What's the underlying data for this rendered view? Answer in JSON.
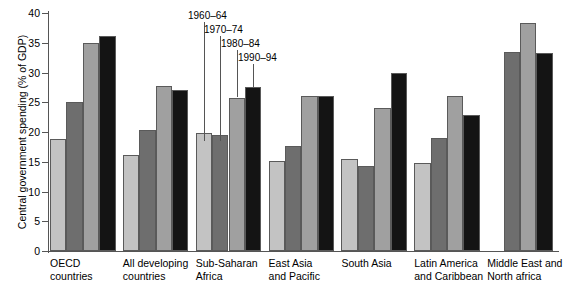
{
  "chart_data": {
    "type": "bar",
    "title": "",
    "xlabel": "",
    "ylabel": "Central government spending (% of GDP)",
    "ylim": [
      0,
      40
    ],
    "ytick_labels": [
      "0",
      "5",
      "10",
      "15",
      "20",
      "25",
      "30",
      "35",
      "40"
    ],
    "ytick_values": [
      0,
      5,
      10,
      15,
      20,
      25,
      30,
      35,
      40
    ],
    "grid": false,
    "legend_position": "inside-top-center",
    "categories": [
      "OECD countries",
      "All developing countries",
      "Sub-Saharan Africa",
      "East Asia and Pacific",
      "South Asia",
      "Latin America and Caribbean",
      "Middle East and North africa"
    ],
    "category_lines": [
      [
        "OECD",
        "countries"
      ],
      [
        "All developing",
        "countries"
      ],
      [
        "Sub-Saharan",
        "Africa"
      ],
      [
        "East Asia",
        "and Pacific"
      ],
      [
        "South Asia",
        ""
      ],
      [
        "Latin America",
        "and Caribbean"
      ],
      [
        "Middle East and",
        "North africa"
      ]
    ],
    "series": [
      {
        "name": "1960–64",
        "color": "#c3c3c3",
        "values": [
          18.8,
          16.2,
          19.9,
          15.2,
          15.4,
          14.8,
          null
        ]
      },
      {
        "name": "1970–74",
        "color": "#6e6e6e",
        "values": [
          25.0,
          20.4,
          19.5,
          17.6,
          14.3,
          19.0,
          33.4
        ]
      },
      {
        "name": "1980–84",
        "color": "#a0a0a0",
        "values": [
          34.9,
          27.8,
          25.8,
          26.0,
          24.0,
          26.1,
          38.4
        ]
      },
      {
        "name": "1990–94",
        "color": "#141414",
        "values": [
          36.2,
          27.0,
          27.6,
          26.0,
          30.0,
          22.8,
          33.2
        ]
      }
    ]
  },
  "legend_callouts": [
    {
      "label": "1960–64"
    },
    {
      "label": "1970–74"
    },
    {
      "label": "1980–84"
    },
    {
      "label": "1990–94"
    }
  ]
}
